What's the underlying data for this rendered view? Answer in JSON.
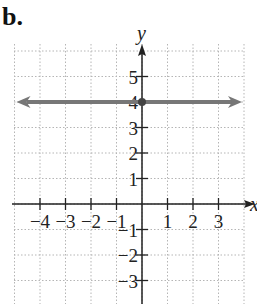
{
  "figure": {
    "label": "b."
  },
  "chart_data": {
    "type": "line",
    "title": "",
    "xlabel": "x",
    "ylabel": "y",
    "xlim": [
      -5,
      4
    ],
    "ylim": [
      -4,
      6
    ],
    "grid": true,
    "x_ticks": [
      -4,
      -3,
      -2,
      -1,
      1,
      2,
      3
    ],
    "y_ticks": [
      5,
      4,
      3,
      2,
      1,
      -1,
      -2,
      -3
    ],
    "x_tick_labels": [
      "−4",
      "−3",
      "−2",
      "−1",
      "1",
      "2",
      "3"
    ],
    "y_tick_labels": [
      "5",
      "4",
      "3",
      "2",
      "1",
      "−1",
      "−2",
      "−3"
    ],
    "series": [
      {
        "name": "y = 4",
        "equation": "y = 4",
        "type": "horizontal-line",
        "x": [
          -5,
          4
        ],
        "y": [
          4,
          4
        ],
        "color": "#777777",
        "arrows": "both"
      }
    ],
    "points": [
      {
        "x": 0,
        "y": 4,
        "color": "#444444"
      }
    ]
  }
}
